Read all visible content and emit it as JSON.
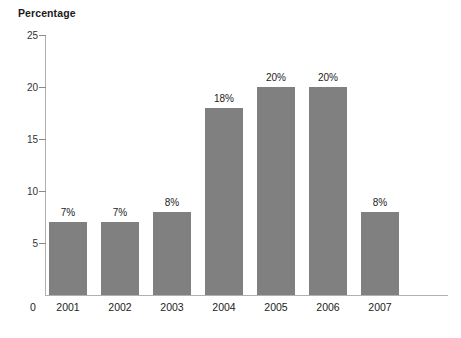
{
  "chart_data": {
    "type": "bar",
    "title": "",
    "ylabel": "Percentage",
    "xlabel": "",
    "categories": [
      "2001",
      "2002",
      "2003",
      "2004",
      "2005",
      "2006",
      "2007"
    ],
    "values": [
      7,
      7,
      8,
      18,
      20,
      20,
      8
    ],
    "data_labels": [
      "7%",
      "7%",
      "8%",
      "18%",
      "20%",
      "20%",
      "8%"
    ],
    "ylim": [
      0,
      25
    ],
    "yticks": [
      0,
      5,
      10,
      15,
      20,
      25
    ],
    "ytick_labels": [
      "0",
      "5",
      "10",
      "15",
      "20",
      "25"
    ],
    "grid": false,
    "legend": null,
    "bar_color": "#808080",
    "axis_color": "#b0b0b0",
    "background": "#ffffff"
  }
}
